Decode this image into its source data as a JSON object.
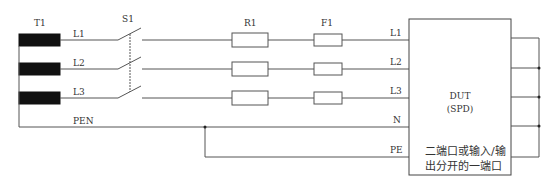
{
  "labels": {
    "transformer": "T1",
    "switch": "S1",
    "resistor": "R1",
    "fuse": "F1",
    "src_l1": "L1",
    "src_l2": "L2",
    "src_l3": "L3",
    "src_pen": "PEN",
    "dut_l1": "L1",
    "dut_l2": "L2",
    "dut_l3": "L3",
    "dut_n": "N",
    "dut_pe": "PE",
    "dut_title": "DUT",
    "dut_subtitle": "(SPD)",
    "dut_note_line1": "二端口或输入/输",
    "dut_note_line2": "出分开的一端口"
  },
  "colors": {
    "line": "#555555",
    "fill": "#111111",
    "text": "#333333"
  }
}
